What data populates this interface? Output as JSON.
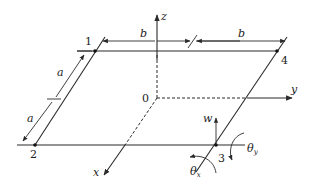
{
  "figure": {
    "colors": {
      "line": "#2a2a2a",
      "background": "#ffffff"
    },
    "nodes": [
      {
        "id": "1",
        "label": "1"
      },
      {
        "id": "2",
        "label": "2"
      },
      {
        "id": "3",
        "label": "3"
      },
      {
        "id": "4",
        "label": "4"
      }
    ],
    "axes": {
      "origin": "0",
      "x": "x",
      "y": "y",
      "z": "z"
    },
    "dimensions": {
      "b_left": "b",
      "b_right": "b",
      "a_upper": "a",
      "a_lower": "a"
    },
    "dofs": {
      "w": "w",
      "theta_x": {
        "symbol": "θ",
        "subscript": "x"
      },
      "theta_y": {
        "symbol": "θ",
        "subscript": "y"
      }
    }
  }
}
